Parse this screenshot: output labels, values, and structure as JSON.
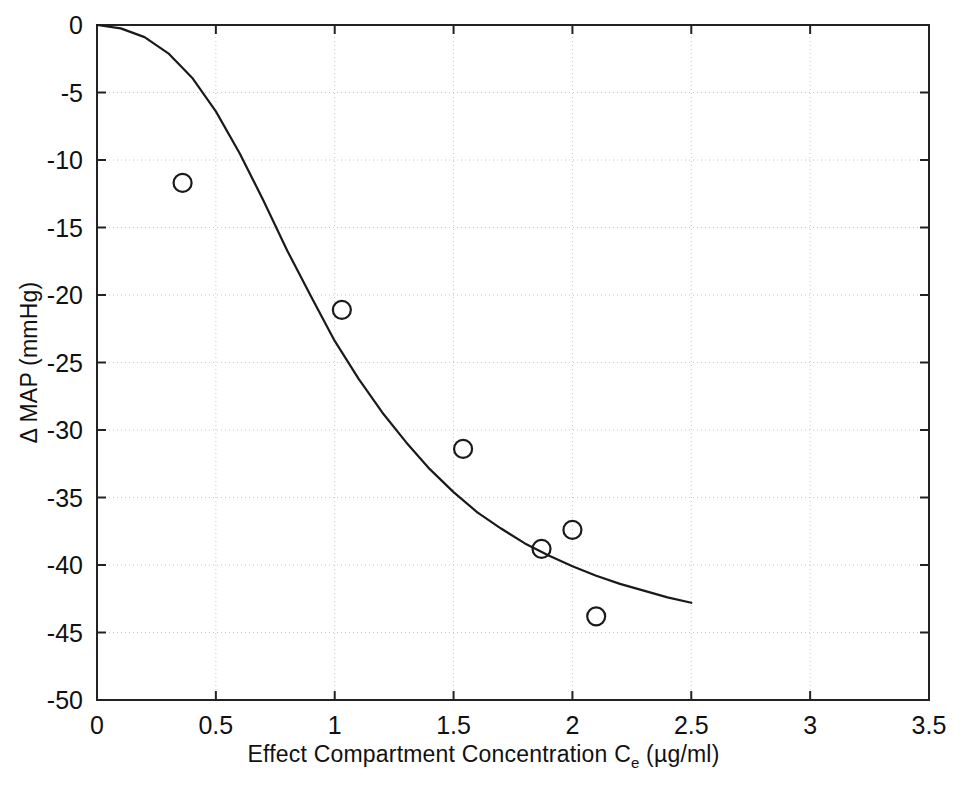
{
  "figure": {
    "background": "#ffffff",
    "axis_color": "#222222",
    "grid_color": "#c8c8c8",
    "curve_color": "#1a1a1a",
    "marker_color": "#1a1a1a"
  },
  "labels": {
    "xlabel_main": "Effect Compartment Concentration C",
    "xlabel_sub": "e",
    "xlabel_units": " (µg/ml)",
    "ylabel": "Δ MAP (mmHg)"
  },
  "chart_data": {
    "type": "scatter",
    "title": "",
    "xlabel": "Effect Compartment Concentration Ce (µg/ml)",
    "ylabel": "Δ MAP (mmHg)",
    "xlim": [
      0,
      3.5
    ],
    "ylim": [
      -50,
      0
    ],
    "xticks": [
      0,
      0.5,
      1,
      1.5,
      2,
      2.5,
      3,
      3.5
    ],
    "xticklabels": [
      "0",
      "0.5",
      "1",
      "1.5",
      "2",
      "2.5",
      "3",
      "3.5"
    ],
    "yticks": [
      0,
      -5,
      -10,
      -15,
      -20,
      -25,
      -30,
      -35,
      -40,
      -45,
      -50
    ],
    "yticklabels": [
      "0",
      "-5",
      "-10",
      "-15",
      "-20",
      "-25",
      "-30",
      "-35",
      "-40",
      "-45",
      "-50"
    ],
    "grid": true,
    "grid_style": "dotted",
    "legend": "none",
    "series": [
      {
        "name": "Observed data",
        "type": "scatter",
        "marker": "open-circle",
        "x": [
          0.36,
          1.03,
          1.54,
          1.87,
          2.0,
          2.1
        ],
        "y": [
          -11.7,
          -21.1,
          -31.4,
          -38.8,
          -37.4,
          -43.8
        ]
      },
      {
        "name": "Sigmoid Emax fit",
        "type": "line",
        "x": [
          0.0,
          0.1,
          0.2,
          0.3,
          0.4,
          0.5,
          0.6,
          0.7,
          0.8,
          0.9,
          1.0,
          1.1,
          1.2,
          1.3,
          1.4,
          1.5,
          1.6,
          1.7,
          1.8,
          1.9,
          2.0,
          2.1,
          2.2,
          2.3,
          2.4,
          2.5
        ],
        "y": [
          0.0,
          -0.25,
          -0.9,
          -2.1,
          -3.9,
          -6.4,
          -9.5,
          -13.0,
          -16.7,
          -20.1,
          -23.4,
          -26.2,
          -28.7,
          -30.9,
          -32.9,
          -34.6,
          -36.1,
          -37.3,
          -38.4,
          -39.3,
          -40.1,
          -40.8,
          -41.4,
          -41.9,
          -42.4,
          -42.8
        ]
      }
    ]
  }
}
